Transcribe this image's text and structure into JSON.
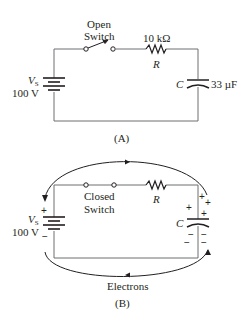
{
  "figure_a": {
    "caption": "(A)",
    "switch_label_line1": "Open",
    "switch_label_line2": "Switch",
    "resistor_value": "10 kΩ",
    "resistor_symbol": "R",
    "capacitor_symbol": "C",
    "capacitor_value": "33 µF",
    "source_symbol": "V",
    "source_subscript": "S",
    "source_value": "100 V"
  },
  "figure_b": {
    "caption": "(B)",
    "switch_label_line1": "Closed",
    "switch_label_line2": "Switch",
    "resistor_symbol": "R",
    "capacitor_symbol": "C",
    "source_symbol": "V",
    "source_subscript": "S",
    "source_value": "100 V",
    "plus_sign": "+",
    "minus_sign": "−",
    "flow_label": "Electrons"
  },
  "colors": {
    "wire": "#6d6e71",
    "ink": "#231f20"
  }
}
